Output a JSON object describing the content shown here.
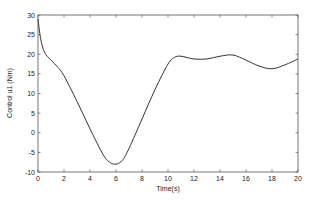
{
  "chart_data": {
    "type": "line",
    "title": "",
    "xlabel": "Time(s)",
    "ylabel": "Control u1 (Nm)",
    "xlim": [
      0,
      20
    ],
    "ylim": [
      -10,
      30
    ],
    "xticks": [
      0,
      2,
      4,
      6,
      8,
      10,
      12,
      14,
      16,
      18,
      20
    ],
    "yticks": [
      -10,
      -5,
      0,
      5,
      10,
      15,
      20,
      25,
      30
    ],
    "grid": false,
    "legend": null,
    "series": [
      {
        "name": "u1",
        "color": "#333333",
        "x": [
          0,
          0.2,
          0.5,
          1,
          1.5,
          2,
          3,
          4,
          5,
          5.5,
          6,
          6.5,
          7,
          8,
          9,
          10,
          10.5,
          11,
          12,
          13,
          14,
          15,
          16,
          17,
          18,
          19,
          20
        ],
        "y": [
          29,
          24,
          20.5,
          18.5,
          16.8,
          14.5,
          8,
          1,
          -5.5,
          -7.5,
          -8,
          -7,
          -4,
          3.5,
          11,
          17.5,
          19.2,
          19.5,
          18.8,
          18.8,
          19.5,
          19.8,
          18.5,
          17,
          16.3,
          17.3,
          18.8
        ]
      }
    ]
  }
}
